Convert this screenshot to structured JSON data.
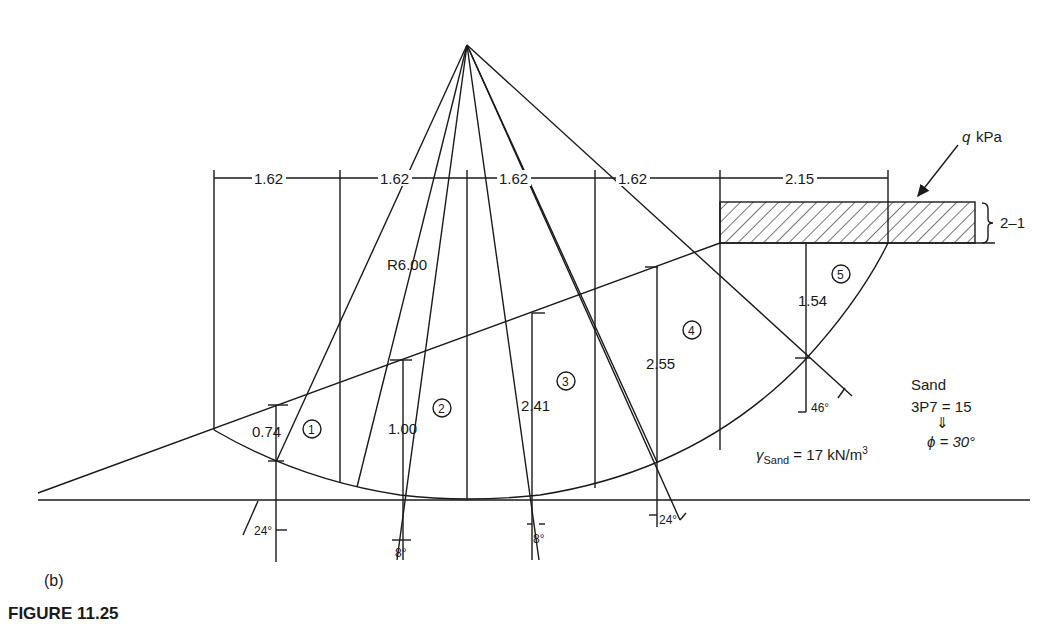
{
  "figure": {
    "caption": "FIGURE 11.25",
    "part_label": "(b)"
  },
  "dimensions": {
    "widths": [
      "1.62",
      "1.62",
      "1.62",
      "1.62",
      "2.15"
    ],
    "surcharge_thickness": "2–1",
    "radius": "R6.00"
  },
  "load": {
    "label_q": "q",
    "label_unit": "kPa"
  },
  "slices": [
    {
      "id": "1",
      "height": "0.74"
    },
    {
      "id": "2",
      "height": "1.00"
    },
    {
      "id": "3",
      "height": "2.41"
    },
    {
      "id": "4",
      "height": "2.55"
    },
    {
      "id": "5",
      "height": "1.54"
    }
  ],
  "angles": {
    "a1": "24°",
    "a2": "8°",
    "a3": "8°",
    "a4": "24°",
    "a5": "46°"
  },
  "soil": {
    "name": "Sand",
    "spt": "3P7 = 15",
    "arrow": "⇓",
    "phi": "ϕ = 30°",
    "unit_weight_symbol": "γ",
    "unit_weight_sub": "Sand",
    "unit_weight_value": " = 17 kN/m",
    "unit_weight_sup": "3"
  },
  "colors": {
    "ink": "#1a1a1a",
    "background": "#ffffff"
  }
}
